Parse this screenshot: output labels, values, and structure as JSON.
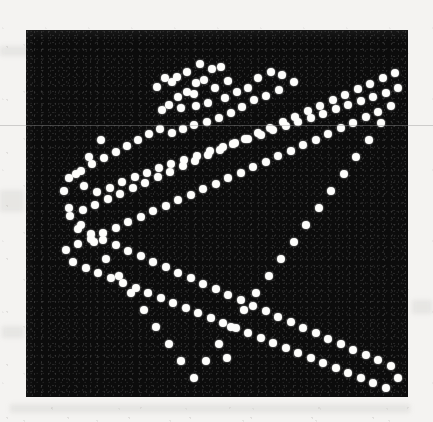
{
  "figure": {
    "kind": "scanned-scatter-figure",
    "page_background_color": "#f4f3f1",
    "panel_background_color": "#0c0c0c",
    "point_color": "#fdfdfb",
    "panel": {
      "x": 26,
      "y": 30,
      "width": 382,
      "height": 367
    },
    "artifact": {
      "name": "horizontal-scan-line",
      "y": 125,
      "color": "#969696"
    }
  },
  "chart_data": {
    "type": "scatter",
    "title": "",
    "subtitle": "",
    "xlabel": "",
    "ylabel": "",
    "legend": [],
    "annotations": [],
    "grid": false,
    "axis_visible": false,
    "tick_labels": {
      "x": [],
      "y": []
    },
    "xlim": [
      0,
      382
    ],
    "ylim": [
      0,
      367
    ],
    "y_axis_inverted": true,
    "marker": {
      "shape": "circle",
      "diameter_px": 8,
      "color": "#fdfdfb"
    },
    "n_points": 206,
    "series": [
      {
        "name": "points",
        "color": "#fdfdfb",
        "points": [
          [
            151,
            47
          ],
          [
            161,
            42
          ],
          [
            174,
            34
          ],
          [
            186,
            39
          ],
          [
            195,
            37
          ],
          [
            170,
            53
          ],
          [
            178,
            50
          ],
          [
            139,
            48
          ],
          [
            146,
            52
          ],
          [
            131,
            57
          ],
          [
            202,
            51
          ],
          [
            161,
            62
          ],
          [
            152,
            67
          ],
          [
            168,
            64
          ],
          [
            189,
            58
          ],
          [
            143,
            75
          ],
          [
            136,
            80
          ],
          [
            155,
            78
          ],
          [
            170,
            76
          ],
          [
            182,
            73
          ],
          [
            199,
            68
          ],
          [
            211,
            62
          ],
          [
            222,
            58
          ],
          [
            232,
            48
          ],
          [
            245,
            42
          ],
          [
            256,
            45
          ],
          [
            268,
            52
          ],
          [
            253,
            60
          ],
          [
            240,
            66
          ],
          [
            228,
            70
          ],
          [
            216,
            77
          ],
          [
            205,
            83
          ],
          [
            193,
            88
          ],
          [
            181,
            92
          ],
          [
            168,
            95
          ],
          [
            157,
            99
          ],
          [
            146,
            103
          ],
          [
            134,
            99
          ],
          [
            123,
            104
          ],
          [
            112,
            110
          ],
          [
            101,
            116
          ],
          [
            90,
            122
          ],
          [
            78,
            128
          ],
          [
            66,
            134
          ],
          [
            55,
            141
          ],
          [
            43,
            148
          ],
          [
            58,
            156
          ],
          [
            71,
            162
          ],
          [
            84,
            158
          ],
          [
            96,
            152
          ],
          [
            109,
            147
          ],
          [
            121,
            143
          ],
          [
            133,
            138
          ],
          [
            145,
            134
          ],
          [
            158,
            130
          ],
          [
            171,
            126
          ],
          [
            184,
            121
          ],
          [
            197,
            117
          ],
          [
            209,
            113
          ],
          [
            222,
            109
          ],
          [
            235,
            105
          ],
          [
            247,
            100
          ],
          [
            260,
            96
          ],
          [
            272,
            92
          ],
          [
            285,
            88
          ],
          [
            297,
            84
          ],
          [
            310,
            79
          ],
          [
            322,
            75
          ],
          [
            335,
            71
          ],
          [
            347,
            67
          ],
          [
            360,
            63
          ],
          [
            372,
            58
          ],
          [
            365,
            76
          ],
          [
            352,
            82
          ],
          [
            340,
            87
          ],
          [
            327,
            93
          ],
          [
            315,
            98
          ],
          [
            302,
            104
          ],
          [
            290,
            110
          ],
          [
            277,
            115
          ],
          [
            265,
            121
          ],
          [
            252,
            126
          ],
          [
            240,
            132
          ],
          [
            227,
            137
          ],
          [
            215,
            143
          ],
          [
            202,
            148
          ],
          [
            190,
            154
          ],
          [
            177,
            159
          ],
          [
            165,
            165
          ],
          [
            152,
            170
          ],
          [
            140,
            176
          ],
          [
            127,
            181
          ],
          [
            115,
            187
          ],
          [
            102,
            192
          ],
          [
            90,
            198
          ],
          [
            77,
            203
          ],
          [
            65,
            209
          ],
          [
            52,
            214
          ],
          [
            40,
            220
          ],
          [
            47,
            232
          ],
          [
            60,
            238
          ],
          [
            72,
            243
          ],
          [
            85,
            248
          ],
          [
            97,
            253
          ],
          [
            110,
            258
          ],
          [
            122,
            263
          ],
          [
            135,
            268
          ],
          [
            147,
            273
          ],
          [
            160,
            278
          ],
          [
            172,
            283
          ],
          [
            185,
            288
          ],
          [
            197,
            293
          ],
          [
            210,
            298
          ],
          [
            222,
            303
          ],
          [
            235,
            308
          ],
          [
            247,
            313
          ],
          [
            260,
            318
          ],
          [
            272,
            323
          ],
          [
            285,
            328
          ],
          [
            297,
            333
          ],
          [
            310,
            338
          ],
          [
            322,
            343
          ],
          [
            335,
            348
          ],
          [
            347,
            353
          ],
          [
            360,
            358
          ],
          [
            372,
            348
          ],
          [
            365,
            336
          ],
          [
            352,
            330
          ],
          [
            340,
            325
          ],
          [
            327,
            320
          ],
          [
            315,
            314
          ],
          [
            302,
            309
          ],
          [
            290,
            303
          ],
          [
            277,
            298
          ],
          [
            265,
            292
          ],
          [
            252,
            287
          ],
          [
            240,
            281
          ],
          [
            227,
            276
          ],
          [
            215,
            270
          ],
          [
            202,
            265
          ],
          [
            190,
            259
          ],
          [
            177,
            254
          ],
          [
            165,
            248
          ],
          [
            152,
            243
          ],
          [
            140,
            237
          ],
          [
            127,
            232
          ],
          [
            115,
            226
          ],
          [
            102,
            221
          ],
          [
            90,
            215
          ],
          [
            77,
            210
          ],
          [
            65,
            204
          ],
          [
            52,
            199
          ],
          [
            44,
            186
          ],
          [
            57,
            180
          ],
          [
            69,
            175
          ],
          [
            82,
            169
          ],
          [
            94,
            164
          ],
          [
            107,
            158
          ],
          [
            119,
            153
          ],
          [
            132,
            147
          ],
          [
            144,
            142
          ],
          [
            157,
            136
          ],
          [
            169,
            131
          ],
          [
            182,
            125
          ],
          [
            194,
            120
          ],
          [
            207,
            114
          ],
          [
            219,
            109
          ],
          [
            232,
            103
          ],
          [
            244,
            98
          ],
          [
            257,
            92
          ],
          [
            269,
            87
          ],
          [
            282,
            81
          ],
          [
            294,
            76
          ],
          [
            307,
            70
          ],
          [
            319,
            65
          ],
          [
            332,
            59
          ],
          [
            344,
            54
          ],
          [
            357,
            48
          ],
          [
            369,
            43
          ],
          [
            355,
            93
          ],
          [
            343,
            110
          ],
          [
            330,
            127
          ],
          [
            318,
            144
          ],
          [
            305,
            161
          ],
          [
            293,
            178
          ],
          [
            280,
            195
          ],
          [
            268,
            212
          ],
          [
            255,
            229
          ],
          [
            243,
            246
          ],
          [
            230,
            263
          ],
          [
            218,
            280
          ],
          [
            205,
            297
          ],
          [
            193,
            314
          ],
          [
            180,
            331
          ],
          [
            168,
            348
          ],
          [
            155,
            331
          ],
          [
            143,
            314
          ],
          [
            130,
            297
          ],
          [
            118,
            280
          ],
          [
            105,
            263
          ],
          [
            93,
            246
          ],
          [
            80,
            229
          ],
          [
            68,
            212
          ],
          [
            55,
            195
          ],
          [
            43,
            178
          ],
          [
            38,
            161
          ],
          [
            50,
            144
          ],
          [
            63,
            127
          ],
          [
            75,
            110
          ],
          [
            201,
            328
          ]
        ]
      }
    ]
  }
}
